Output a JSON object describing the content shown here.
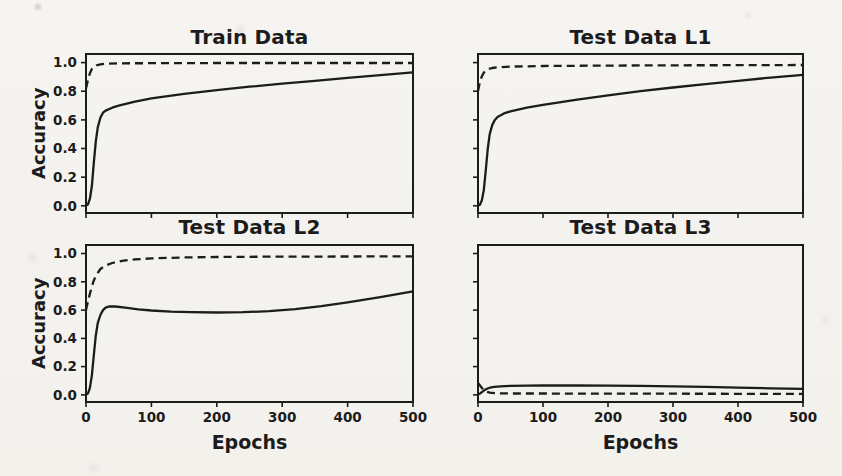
{
  "figure": {
    "background": "#f4f2ee",
    "ink": "#1c1c1c",
    "dash_pattern": "8 5"
  },
  "chart_data": [
    {
      "type": "line",
      "title": "Train Data",
      "xlabel": "",
      "ylabel": "Accuracy",
      "xlim": [
        0,
        500
      ],
      "ylim": [
        -0.05,
        1.06
      ],
      "x_ticks": [
        0,
        100,
        200,
        300,
        400,
        500
      ],
      "y_ticks": [
        0,
        0.2,
        0.4,
        0.6,
        0.8,
        1.0
      ],
      "show_x_tick_labels": false,
      "show_y_tick_labels": true,
      "grid": false,
      "legend": "none",
      "series": [
        {
          "name": "solid",
          "style": "solid",
          "x": [
            0,
            3,
            6,
            9,
            12,
            15,
            18,
            22,
            26,
            30,
            40,
            50,
            75,
            100,
            150,
            200,
            250,
            300,
            350,
            400,
            450,
            500
          ],
          "y": [
            0.002,
            0.01,
            0.05,
            0.14,
            0.3,
            0.45,
            0.55,
            0.615,
            0.65,
            0.665,
            0.685,
            0.7,
            0.728,
            0.75,
            0.782,
            0.808,
            0.832,
            0.853,
            0.872,
            0.893,
            0.912,
            0.932
          ]
        },
        {
          "name": "dashed",
          "style": "dashed",
          "x": [
            0,
            3,
            6,
            9,
            12,
            16,
            22,
            30,
            50,
            100,
            200,
            300,
            400,
            500
          ],
          "y": [
            0.82,
            0.88,
            0.925,
            0.955,
            0.97,
            0.981,
            0.988,
            0.992,
            0.995,
            0.996,
            0.997,
            0.997,
            0.997,
            0.997
          ]
        }
      ]
    },
    {
      "type": "line",
      "title": "Test Data L1",
      "xlabel": "",
      "ylabel": "",
      "xlim": [
        0,
        500
      ],
      "ylim": [
        -0.05,
        1.06
      ],
      "x_ticks": [
        0,
        100,
        200,
        300,
        400,
        500
      ],
      "y_ticks": [
        0,
        0.2,
        0.4,
        0.6,
        0.8,
        1.0
      ],
      "show_x_tick_labels": false,
      "show_y_tick_labels": false,
      "grid": false,
      "legend": "none",
      "series": [
        {
          "name": "solid",
          "style": "solid",
          "x": [
            0,
            3,
            6,
            9,
            12,
            15,
            18,
            22,
            26,
            30,
            40,
            50,
            75,
            100,
            150,
            200,
            250,
            300,
            350,
            400,
            450,
            500
          ],
          "y": [
            0.002,
            0.008,
            0.04,
            0.11,
            0.25,
            0.4,
            0.5,
            0.565,
            0.6,
            0.62,
            0.645,
            0.66,
            0.685,
            0.705,
            0.74,
            0.772,
            0.8,
            0.826,
            0.85,
            0.872,
            0.895,
            0.915
          ]
        },
        {
          "name": "dashed",
          "style": "dashed",
          "x": [
            0,
            3,
            6,
            9,
            12,
            16,
            22,
            30,
            50,
            100,
            200,
            300,
            400,
            500
          ],
          "y": [
            0.8,
            0.865,
            0.905,
            0.93,
            0.945,
            0.955,
            0.962,
            0.967,
            0.972,
            0.976,
            0.979,
            0.981,
            0.982,
            0.983
          ]
        }
      ]
    },
    {
      "type": "line",
      "title": "Test Data L2",
      "xlabel": "Epochs",
      "ylabel": "Accuracy",
      "xlim": [
        0,
        500
      ],
      "ylim": [
        -0.05,
        1.06
      ],
      "x_ticks": [
        0,
        100,
        200,
        300,
        400,
        500
      ],
      "y_ticks": [
        0,
        0.2,
        0.4,
        0.6,
        0.8,
        1.0
      ],
      "show_x_tick_labels": true,
      "show_y_tick_labels": true,
      "grid": false,
      "legend": "none",
      "series": [
        {
          "name": "solid",
          "style": "solid",
          "x": [
            0,
            3,
            6,
            9,
            12,
            15,
            18,
            22,
            26,
            30,
            35,
            45,
            60,
            80,
            100,
            130,
            160,
            200,
            240,
            280,
            320,
            360,
            400,
            450,
            500
          ],
          "y": [
            0.002,
            0.01,
            0.05,
            0.14,
            0.28,
            0.42,
            0.51,
            0.565,
            0.6,
            0.617,
            0.625,
            0.625,
            0.617,
            0.605,
            0.597,
            0.589,
            0.585,
            0.583,
            0.585,
            0.592,
            0.606,
            0.627,
            0.655,
            0.692,
            0.732
          ]
        },
        {
          "name": "dashed",
          "style": "dashed",
          "x": [
            0,
            4,
            8,
            12,
            16,
            22,
            30,
            40,
            55,
            75,
            100,
            150,
            200,
            300,
            400,
            500
          ],
          "y": [
            0.6,
            0.68,
            0.75,
            0.81,
            0.85,
            0.89,
            0.915,
            0.933,
            0.948,
            0.958,
            0.965,
            0.972,
            0.975,
            0.978,
            0.979,
            0.98
          ]
        }
      ]
    },
    {
      "type": "line",
      "title": "Test Data L3",
      "xlabel": "Epochs",
      "ylabel": "",
      "xlim": [
        0,
        500
      ],
      "ylim": [
        -0.05,
        1.06
      ],
      "x_ticks": [
        0,
        100,
        200,
        300,
        400,
        500
      ],
      "y_ticks": [
        0,
        0.2,
        0.4,
        0.6,
        0.8,
        1.0
      ],
      "show_x_tick_labels": true,
      "show_y_tick_labels": false,
      "grid": false,
      "legend": "none",
      "series": [
        {
          "name": "solid",
          "style": "solid",
          "x": [
            0,
            4,
            8,
            12,
            18,
            25,
            35,
            50,
            75,
            100,
            150,
            200,
            250,
            300,
            350,
            400,
            450,
            500
          ],
          "y": [
            0.002,
            0.012,
            0.027,
            0.04,
            0.051,
            0.057,
            0.061,
            0.064,
            0.066,
            0.067,
            0.067,
            0.066,
            0.064,
            0.061,
            0.057,
            0.052,
            0.047,
            0.043
          ]
        },
        {
          "name": "dashed",
          "style": "dashed",
          "x": [
            0,
            4,
            8,
            12,
            18,
            25,
            35,
            50,
            100,
            200,
            300,
            400,
            500
          ],
          "y": [
            0.085,
            0.062,
            0.038,
            0.024,
            0.016,
            0.013,
            0.011,
            0.01,
            0.01,
            0.009,
            0.009,
            0.008,
            0.008
          ]
        }
      ]
    }
  ]
}
